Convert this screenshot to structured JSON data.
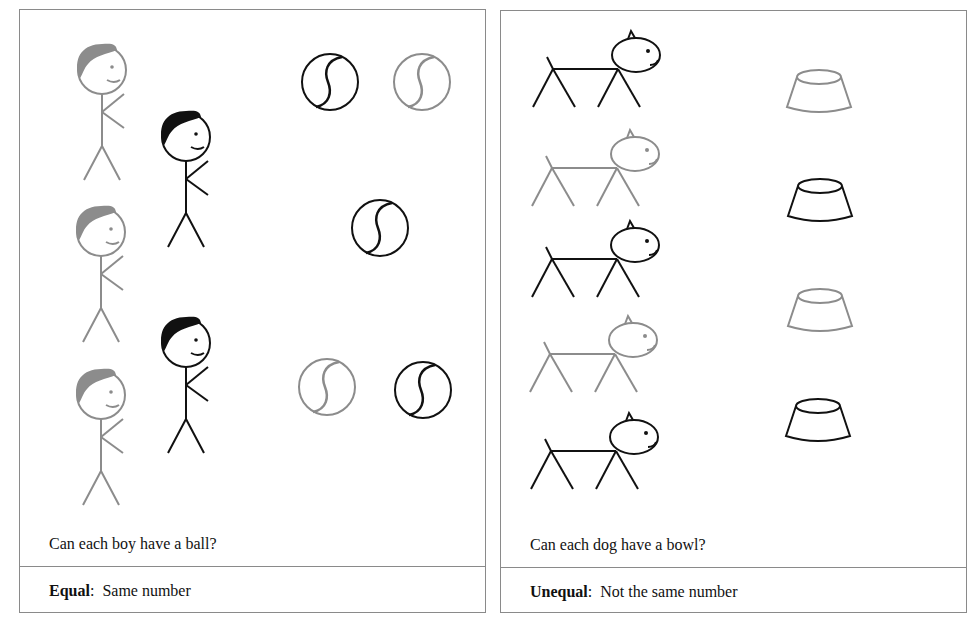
{
  "panels": [
    {
      "id": "boys-balls",
      "question": "Can each boy have a ball?",
      "caption_term": "Equal",
      "caption_sep": ":",
      "caption_text": "Same number",
      "items": {
        "boys": 5,
        "balls": 5
      }
    },
    {
      "id": "dogs-bowls",
      "question": "Can each dog have a bowl?",
      "caption_term": "Unequal",
      "caption_sep": ":",
      "caption_text": "Not the same number",
      "items": {
        "dogs": 5,
        "bowls": 4
      }
    }
  ],
  "colors": {
    "dark": "#111111",
    "light": "#8c8c8c",
    "border": "#8a8a8a"
  }
}
